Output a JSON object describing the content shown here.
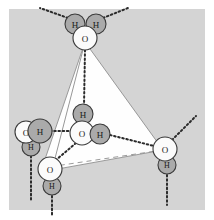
{
  "figure": {
    "background_color": "#d4d4d4",
    "page_color": "#ffffff",
    "atom_colors": {
      "oxygen_fill": "#fbfbfb",
      "hydrogen_fill": "#aaaaaa",
      "outline": "#3a3a3a",
      "tetrahedron_face": "#fefefe",
      "tetrahedron_edge": "#8f8f8f",
      "bond_dotted": "#2b2b2b"
    },
    "labels": {
      "oxygen": "O",
      "hydrogen": "H"
    },
    "molecules": [
      {
        "name": "top-water-molecule",
        "position": "apex",
        "atoms": [
          {
            "element": "H",
            "label": "H",
            "x": 75,
            "y": 24,
            "r": 10,
            "type": "hydrogen"
          },
          {
            "element": "H",
            "label": "H",
            "x": 96,
            "y": 24,
            "r": 10,
            "type": "hydrogen"
          },
          {
            "element": "O",
            "label": "O",
            "x": 85,
            "y": 38,
            "r": 12,
            "type": "oxygen"
          }
        ]
      },
      {
        "name": "center-water-molecule",
        "position": "center",
        "atoms": [
          {
            "element": "H",
            "label": "H",
            "x": 83,
            "y": 114,
            "r": 10,
            "type": "hydrogen"
          },
          {
            "element": "O",
            "label": "O",
            "x": 82,
            "y": 133,
            "r": 12,
            "type": "oxygen"
          },
          {
            "element": "H",
            "label": "H",
            "x": 100,
            "y": 134,
            "r": 10,
            "type": "hydrogen"
          }
        ]
      },
      {
        "name": "left-water-molecule",
        "position": "left-vertex",
        "atoms": [
          {
            "element": "H",
            "label": "H",
            "x": 31,
            "y": 147,
            "r": 9,
            "type": "hydrogen"
          },
          {
            "element": "O",
            "label": "O",
            "x": 26,
            "y": 132,
            "r": 11,
            "type": "oxygen"
          },
          {
            "element": "H",
            "label": "H",
            "x": 40,
            "y": 131,
            "r": 12,
            "type": "hydrogen"
          }
        ]
      },
      {
        "name": "bottom-water-molecule",
        "position": "bottom-vertex",
        "atoms": [
          {
            "element": "H",
            "label": "H",
            "x": 52,
            "y": 186,
            "r": 9,
            "type": "hydrogen"
          },
          {
            "element": "O",
            "label": "O",
            "x": 50,
            "y": 169,
            "r": 12,
            "type": "oxygen"
          }
        ]
      },
      {
        "name": "right-water-molecule",
        "position": "right-vertex",
        "atoms": [
          {
            "element": "H",
            "label": "H",
            "x": 167,
            "y": 165,
            "r": 9,
            "type": "hydrogen"
          },
          {
            "element": "O",
            "label": "O",
            "x": 165,
            "y": 149,
            "r": 12,
            "type": "oxygen"
          }
        ]
      }
    ],
    "tetrahedron": {
      "apex": {
        "x": 85,
        "y": 42
      },
      "left_vertex": {
        "x": 42,
        "y": 168
      },
      "bottom_vertex": {
        "x": 52,
        "y": 170
      },
      "right_vertex": {
        "x": 163,
        "y": 150
      }
    },
    "hydrogen_bonds": [
      {
        "name": "apex-to-center",
        "from": [
          85,
          50
        ],
        "to": [
          84,
          106
        ]
      },
      {
        "name": "left-to-center",
        "from": [
          50,
          131
        ],
        "to": [
          72,
          131
        ]
      },
      {
        "name": "center-to-right",
        "from": [
          110,
          135
        ],
        "to": [
          154,
          146
        ]
      },
      {
        "name": "center-to-bottom",
        "from": [
          76,
          143
        ],
        "to": [
          56,
          160
        ]
      }
    ],
    "external_bonds": [
      {
        "name": "top-left-external",
        "from": [
          68,
          18
        ],
        "to": [
          40,
          8
        ]
      },
      {
        "name": "top-right-external",
        "from": [
          103,
          18
        ],
        "to": [
          128,
          8
        ]
      },
      {
        "name": "right-external",
        "from": [
          172,
          140
        ],
        "to": [
          196,
          116
        ]
      },
      {
        "name": "left-external",
        "from": [
          31,
          156
        ],
        "to": [
          31,
          200
        ]
      },
      {
        "name": "bottom-external",
        "from": [
          52,
          196
        ],
        "to": [
          52,
          216
        ]
      },
      {
        "name": "right-bottom-external",
        "from": [
          167,
          175
        ],
        "to": [
          167,
          205
        ]
      }
    ]
  }
}
